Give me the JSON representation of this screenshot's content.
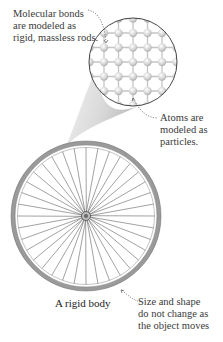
{
  "figure": {
    "title": "A rigid body",
    "annotations": [
      {
        "id": "bonds",
        "text": "Molecular bonds\nare modeled as\nrigid, massless rods."
      },
      {
        "id": "atoms",
        "text": "Atoms are\nmodeled as\nparticles."
      },
      {
        "id": "shape",
        "text": "Size and shape\ndo not change as\nthe object moves"
      }
    ],
    "elements": {
      "magnifier": "atomic-lattice-magnifier",
      "wheel": "bicycle-wheel",
      "spoke_count": 36
    },
    "colors": {
      "rim": "#a9a9a9",
      "spoke": "#555555",
      "atom": "#d0d0d0",
      "leader": "#555555"
    }
  }
}
